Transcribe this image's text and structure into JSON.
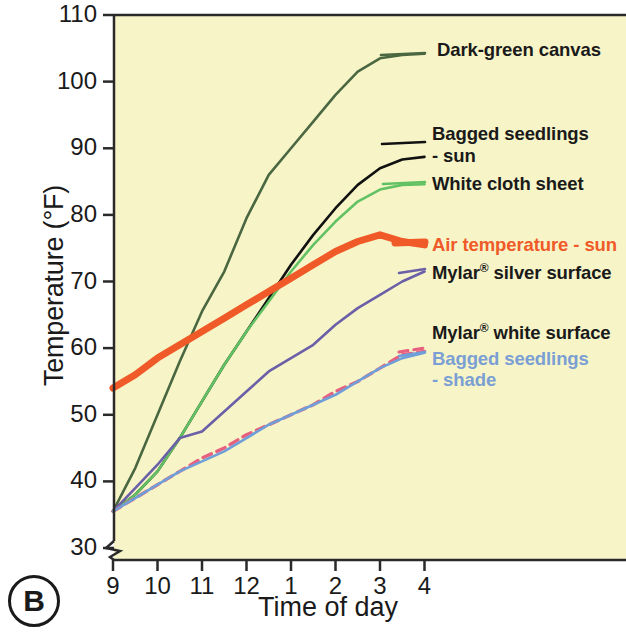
{
  "panel": {
    "tag": "B"
  },
  "axes": {
    "ylabel": "Temperature (°F)",
    "xlabel": "Time of day",
    "yticks": [
      "110",
      "100",
      "90",
      "80",
      "70",
      "60",
      "50",
      "40",
      "30"
    ],
    "xticks": [
      "9",
      "10",
      "11",
      "12",
      "1",
      "2",
      "3",
      "4"
    ],
    "axis_break": true
  },
  "colors": {
    "background": "#f7f5c8",
    "axis": "#1a1a1a",
    "dark_green": "#4a6741",
    "black": "#111111",
    "light_green": "#62c263",
    "orange": "#f05a28",
    "purple": "#6b5fa8",
    "blue": "#6f9fd8",
    "pink": "#e8607f"
  },
  "chart_data": {
    "type": "line",
    "title": "",
    "xlabel": "Time of day",
    "ylabel": "Temperature (°F)",
    "xlim": [
      9,
      16
    ],
    "ylim": [
      30,
      110
    ],
    "grid": false,
    "legend": "inline-right-labels",
    "x": [
      9,
      9.5,
      10,
      10.5,
      11,
      11.5,
      12,
      12.5,
      13,
      13.5,
      14,
      14.5,
      15,
      15.5,
      16
    ],
    "series": [
      {
        "name": "Dark-green canvas",
        "color": "#4a6741",
        "style": "solid",
        "values": [
          35.5,
          42,
          50,
          58,
          65.5,
          71.5,
          79.5,
          86,
          90,
          94,
          98,
          101.5,
          103.5,
          104,
          104.2
        ]
      },
      {
        "name": "Bagged seedlings - sun",
        "color": "#111111",
        "style": "solid",
        "values": [
          35.5,
          38,
          41.5,
          46.5,
          52,
          57.5,
          62.5,
          67.5,
          72.5,
          77,
          81,
          84.5,
          87,
          88.3,
          88.7
        ]
      },
      {
        "name": "White cloth sheet",
        "color": "#62c263",
        "style": "solid",
        "values": [
          35.5,
          38,
          41.5,
          46.5,
          52,
          57.5,
          62.5,
          67,
          71.5,
          75.5,
          79,
          82,
          83.8,
          84.5,
          84.6
        ]
      },
      {
        "name": "Air temperature - sun",
        "color": "#f05a28",
        "style": "solid-thick",
        "values": [
          54,
          56,
          58.5,
          60.5,
          62.5,
          64.5,
          66.5,
          68.5,
          70.5,
          72.5,
          74.5,
          76,
          77,
          76,
          75.5
        ]
      },
      {
        "name": "Mylar® silver surface",
        "color": "#6b5fa8",
        "style": "solid",
        "values": [
          35.5,
          39,
          42.5,
          46.5,
          47.5,
          50.5,
          53.5,
          56.5,
          58.5,
          60.5,
          63.5,
          66,
          68,
          70,
          71.5
        ]
      },
      {
        "name": "Mylar® white surface",
        "color": "#e8607f",
        "style": "dashed",
        "values": [
          35.5,
          37.5,
          39.5,
          41.5,
          43.5,
          45,
          47,
          48.5,
          50,
          51.5,
          53.5,
          55,
          57,
          59,
          59.5
        ]
      },
      {
        "name": "Bagged seedlings - shade",
        "color": "#6f9fd8",
        "style": "solid",
        "values": [
          35.5,
          37.5,
          39.5,
          41.5,
          43,
          44.5,
          46.5,
          48.5,
          50,
          51.5,
          53,
          55,
          57,
          58.5,
          59.3
        ]
      }
    ]
  },
  "series_labels": [
    {
      "id": "dark-green-canvas",
      "text": "Dark-green canvas",
      "color": "#1a1a1a",
      "x": 437,
      "y": 40
    },
    {
      "id": "bagged-seedlings-sun-line1",
      "text": "Bagged seedlings",
      "color": "#1a1a1a",
      "x": 432,
      "y": 124
    },
    {
      "id": "bagged-seedlings-sun-line2",
      "text": "- sun",
      "color": "#1a1a1a",
      "x": 432,
      "y": 146
    },
    {
      "id": "white-cloth-sheet",
      "text": "White cloth sheet",
      "color": "#1a1a1a",
      "x": 432,
      "y": 174
    },
    {
      "id": "air-temperature-sun",
      "text": "Air temperature - sun",
      "color": "#f05a28",
      "x": 432,
      "y": 235
    },
    {
      "id": "mylar-silver-surface",
      "text": "Mylar® silver surface",
      "color": "#1a1a1a",
      "x": 432,
      "y": 262
    },
    {
      "id": "mylar-white-surface",
      "text": "Mylar® white surface",
      "color": "#1a1a1a",
      "x": 432,
      "y": 322
    },
    {
      "id": "bagged-seedlings-shade-line1",
      "text": "Bagged seedlings",
      "color": "#7b9fd4",
      "x": 432,
      "y": 349
    },
    {
      "id": "bagged-seedlings-shade-line2",
      "text": "- shade",
      "color": "#7b9fd4",
      "x": 432,
      "y": 370
    }
  ]
}
